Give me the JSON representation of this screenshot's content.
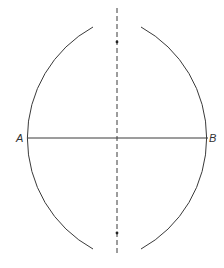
{
  "diagram": {
    "colors": {
      "stroke": "#3a3a3a",
      "background": "#ffffff"
    },
    "segment": {
      "start_label": "A",
      "end_label": "B",
      "start": [
        28,
        138
      ],
      "end": [
        208,
        138
      ]
    },
    "points": {
      "A": {
        "label": "A",
        "x": 20,
        "y": 142
      },
      "B": {
        "label": "B",
        "x": 206,
        "y": 142
      }
    },
    "arcs": [
      {
        "name": "arc-from-A",
        "center": [
          34.3,
          138
        ],
        "radius": 126.7
      },
      {
        "name": "arc-from-B",
        "center": [
          199.7,
          138
        ],
        "radius": 126.7
      }
    ],
    "intersections": [
      {
        "name": "upper-intersection",
        "x": 117,
        "y": 42
      },
      {
        "name": "lower-intersection",
        "x": 117,
        "y": 233
      }
    ],
    "bisector": {
      "style": "dashed",
      "x": 117,
      "y_start": 8,
      "y_end": 256
    }
  }
}
